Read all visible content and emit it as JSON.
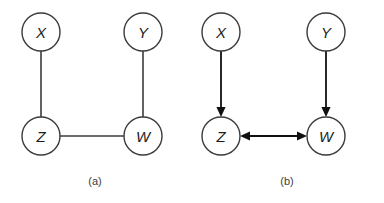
{
  "figure": {
    "background_color": "#ffffff",
    "stroke_color": "#3b3b3b",
    "arrow_color": "#111111",
    "label_color": "#1c1c1c",
    "panels": [
      {
        "id": "panel-a",
        "caption": "(a)",
        "caption_x": 95,
        "caption_y": 181,
        "graph_kind": "undirected",
        "nodes": [
          {
            "id": "X",
            "label": "X",
            "cx": 41,
            "cy": 32,
            "r": 19
          },
          {
            "id": "Y",
            "label": "Y",
            "cx": 143,
            "cy": 32,
            "r": 19
          },
          {
            "id": "Z",
            "label": "Z",
            "cx": 41,
            "cy": 136,
            "r": 19
          },
          {
            "id": "W",
            "label": "W",
            "cx": 143,
            "cy": 136,
            "r": 19
          }
        ],
        "edges": [
          {
            "id": "X-Z",
            "from": "X",
            "to": "Z",
            "type": "undirected",
            "x1": 41,
            "y1": 51,
            "x2": 41,
            "y2": 117
          },
          {
            "id": "Y-W",
            "from": "Y",
            "to": "W",
            "type": "undirected",
            "x1": 143,
            "y1": 51,
            "x2": 143,
            "y2": 117
          },
          {
            "id": "Z-W",
            "from": "Z",
            "to": "W",
            "type": "undirected",
            "x1": 60,
            "y1": 136,
            "x2": 124,
            "y2": 136
          }
        ]
      },
      {
        "id": "panel-b",
        "caption": "(b)",
        "caption_x": 287,
        "caption_y": 181,
        "graph_kind": "directed",
        "nodes": [
          {
            "id": "X",
            "label": "X",
            "cx": 221,
            "cy": 32,
            "r": 19
          },
          {
            "id": "Y",
            "label": "Y",
            "cx": 326,
            "cy": 32,
            "r": 19
          },
          {
            "id": "Z",
            "label": "Z",
            "cx": 221,
            "cy": 136,
            "r": 19
          },
          {
            "id": "W",
            "label": "W",
            "cx": 326,
            "cy": 136,
            "r": 19
          }
        ],
        "edges": [
          {
            "id": "X->Z",
            "from": "X",
            "to": "Z",
            "type": "directed",
            "x1": 221,
            "y1": 51,
            "x2": 221,
            "y2": 117
          },
          {
            "id": "Y->W",
            "from": "Y",
            "to": "W",
            "type": "directed",
            "x1": 326,
            "y1": 51,
            "x2": 326,
            "y2": 117
          },
          {
            "id": "Z<->W",
            "from": "Z",
            "to": "W",
            "type": "bidirectional",
            "x1": 240,
            "y1": 136,
            "x2": 307,
            "y2": 136
          }
        ]
      }
    ]
  }
}
